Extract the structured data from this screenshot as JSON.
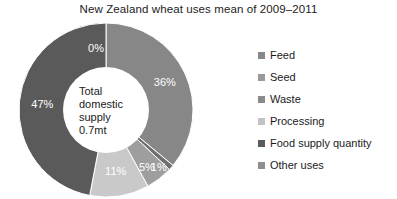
{
  "chart_data": {
    "type": "pie",
    "variant": "donut",
    "title": "New Zealand wheat uses mean of 2009–2011",
    "xlabel": "",
    "ylabel": "",
    "unit": "%",
    "grid": false,
    "legend_position": "right",
    "start_angle_deg": 0,
    "direction": "clockwise",
    "center_label": {
      "lines": [
        "Total",
        "domestic",
        "supply",
        "0.7mt"
      ],
      "text": "Total domestic supply 0.7mt"
    },
    "categories": [
      "Feed",
      "Seed",
      "Waste",
      "Processing",
      "Food supply quantity",
      "Other uses"
    ],
    "values": [
      36,
      1,
      5,
      11,
      47,
      0
    ],
    "data_labels": [
      "36%",
      "1%",
      "5%",
      "11%",
      "47%",
      "0%"
    ],
    "colors": [
      "#878787",
      "#6f6f6f",
      "#9e9e9e",
      "#c9c9c9",
      "#5a5a5a",
      "#8f8f8f"
    ],
    "slices": [
      {
        "name": "Feed",
        "value": 36,
        "label": "36%",
        "color": "#878787"
      },
      {
        "name": "Seed",
        "value": 1,
        "label": "1%",
        "color": "#6f6f6f"
      },
      {
        "name": "Waste",
        "value": 5,
        "label": "5%",
        "color": "#9e9e9e"
      },
      {
        "name": "Processing",
        "value": 11,
        "label": "11%",
        "color": "#c9c9c9"
      },
      {
        "name": "Food supply quantity",
        "value": 47,
        "label": "47%",
        "color": "#5a5a5a"
      },
      {
        "name": "Other uses",
        "value": 0,
        "label": "0%",
        "color": "#8f8f8f"
      }
    ]
  },
  "legend": {
    "items": [
      {
        "label": "Feed",
        "color": "#878787"
      },
      {
        "label": "Seed",
        "color": "#9a9a9a"
      },
      {
        "label": "Waste",
        "color": "#8a8a8a"
      },
      {
        "label": "Processing",
        "color": "#c2c2c2"
      },
      {
        "label": "Food supply quantity",
        "color": "#5a5a5a"
      },
      {
        "label": "Other uses",
        "color": "#8f8f8f"
      }
    ]
  }
}
